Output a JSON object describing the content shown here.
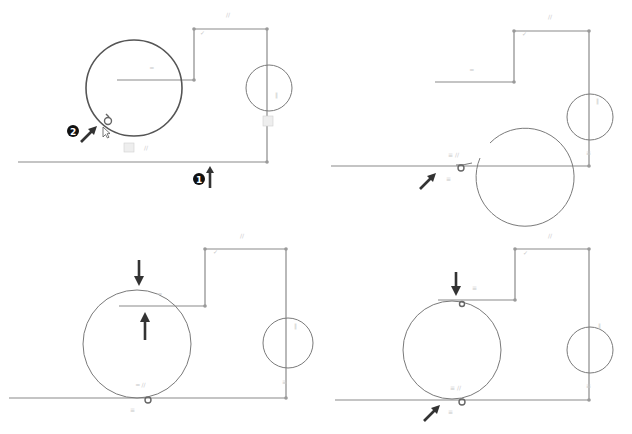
{
  "figure": {
    "panels": [
      {
        "id": "step-1",
        "callouts": [
          {
            "number": "1",
            "target": "bottom horizontal line"
          },
          {
            "number": "2",
            "target": "large circle"
          }
        ],
        "constraint_glyphs": [
          "=",
          "//",
          "⊥",
          "≡"
        ]
      },
      {
        "id": "step-2",
        "callouts": [],
        "constraint_glyphs": [
          "=",
          "//",
          "tangent",
          "≡"
        ]
      },
      {
        "id": "step-3",
        "callouts": [],
        "constraint_glyphs": [
          "=",
          "//",
          "tangent",
          "≡"
        ]
      },
      {
        "id": "step-4",
        "callouts": [],
        "constraint_glyphs": [
          "=",
          "//",
          "tangent",
          "≡"
        ]
      }
    ],
    "icons": {
      "callout_badge": "numbered-circle",
      "cursor": "pointer-arrow",
      "tangent_marker": "tangent-icon",
      "toolbox": "constraint-toolbox-icon"
    },
    "colors": {
      "geometry": "#7a7a7a",
      "selected_geometry": "#555555",
      "arrow": "#333333",
      "badge": "#111111",
      "glyph": "#c8c8c8"
    }
  }
}
